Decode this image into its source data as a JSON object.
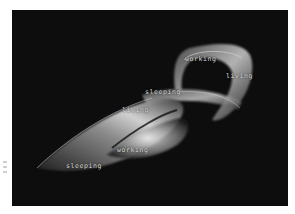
{
  "figure": {
    "background_color": "#0d0d0d",
    "ribbon_color": "#bfbfbf",
    "labels": [
      {
        "id": "working-top",
        "text": "working"
      },
      {
        "id": "living-right",
        "text": "living"
      },
      {
        "id": "sleeping-middle",
        "text": "sleeping"
      },
      {
        "id": "living-middle",
        "text": "living"
      },
      {
        "id": "working-bottom",
        "text": "working"
      },
      {
        "id": "sleeping-bottom",
        "text": "sleeping"
      }
    ]
  }
}
